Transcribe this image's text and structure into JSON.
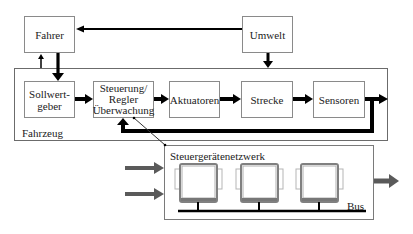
{
  "diagram": {
    "external": {
      "fahrer": "Fahrer",
      "umwelt": "Umwelt"
    },
    "vehicle": {
      "label": "Fahrzeug",
      "blocks": [
        {
          "id": "sollwertgeber",
          "lines": [
            "Sollwert-",
            "geber"
          ]
        },
        {
          "id": "steuerung",
          "lines": [
            "Steuerung/",
            "Regler",
            "Überwachung"
          ]
        },
        {
          "id": "aktuatoren",
          "lines": [
            "Aktuatoren"
          ]
        },
        {
          "id": "strecke",
          "lines": [
            "Strecke"
          ]
        },
        {
          "id": "sensoren",
          "lines": [
            "Sensoren"
          ]
        }
      ]
    },
    "network": {
      "label": "Steuergerätenetzwerk",
      "bus_label": "Bus",
      "ecu_count": 3
    },
    "colors": {
      "arrow": "#000000",
      "box_border": "#8a8a8a",
      "grey_arrow": "#5a5a5a",
      "ecu_frame": "#8c8c8c"
    }
  }
}
